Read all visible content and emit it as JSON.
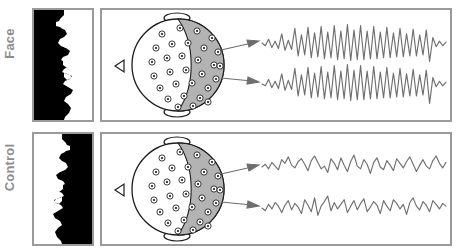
{
  "figure": {
    "title": "",
    "colors": {
      "panel_border": "#9a9a9a",
      "label_text": "#8d8d8d",
      "wave_stroke": "#6f6f6f",
      "head_shade": "#b3b3b3",
      "head_outline": "#1d1d1d",
      "arrow": "#6d6d6d",
      "stimulus_dark": "#000000",
      "stimulus_light": "#ffffff"
    }
  },
  "rows": [
    {
      "id": "face",
      "label": "Face",
      "stimulus": {
        "name": "mooney-face-stimulus",
        "description": "Two-tone Mooney face profile, black region on left, face silhouette facing right",
        "orientation": "upright"
      },
      "head_map": {
        "name": "eeg-head-map",
        "view": "top-down with nose at left",
        "electrode_count": 30,
        "shaded_region": "posterior"
      },
      "arrows": [
        {
          "name": "arrow-to-trace-1"
        },
        {
          "name": "arrow-to-trace-2"
        }
      ],
      "traces": [
        {
          "name": "eeg-trace-1",
          "activity": "high-amplitude regular oscillation",
          "samples": [
            0,
            -3,
            4,
            -5,
            2,
            -6,
            10,
            -8,
            3,
            -7,
            16,
            -14,
            9,
            -13,
            17,
            -16,
            11,
            -15,
            18,
            -17,
            12,
            -16,
            19,
            -18,
            13,
            -17,
            20,
            -19,
            14,
            -18,
            19,
            -18,
            13,
            -17,
            18,
            -17,
            12,
            -16,
            17,
            -16,
            11,
            -15,
            16,
            -15,
            10,
            -14,
            15,
            -14,
            9,
            -13,
            14,
            -20,
            6,
            -4,
            2,
            -3,
            1
          ]
        },
        {
          "name": "eeg-trace-2",
          "activity": "high-amplitude regular oscillation, phase-locked with trace 1",
          "samples": [
            0,
            -2,
            5,
            -4,
            3,
            -5,
            11,
            -7,
            4,
            -6,
            17,
            -13,
            10,
            -12,
            18,
            -15,
            12,
            -14,
            19,
            -16,
            13,
            -15,
            20,
            -17,
            14,
            -16,
            21,
            -18,
            15,
            -17,
            20,
            -17,
            14,
            -16,
            19,
            -16,
            13,
            -15,
            18,
            -15,
            12,
            -14,
            17,
            -14,
            11,
            -13,
            16,
            -13,
            10,
            -12,
            15,
            -21,
            7,
            -3,
            3,
            -2,
            2
          ]
        }
      ]
    },
    {
      "id": "control",
      "label": "Control",
      "stimulus": {
        "name": "control-stimulus",
        "description": "Mirrored and inverted version of the Mooney image, not perceived as a face",
        "orientation": "mirrored"
      },
      "head_map": {
        "name": "eeg-head-map",
        "view": "top-down with nose at left",
        "electrode_count": 30,
        "shaded_region": "posterior"
      },
      "arrows": [
        {
          "name": "arrow-to-trace-1"
        },
        {
          "name": "arrow-to-trace-2"
        }
      ],
      "traces": [
        {
          "name": "eeg-trace-1",
          "activity": "low-amplitude irregular desynchronized activity",
          "samples": [
            0,
            3,
            -2,
            5,
            1,
            -3,
            8,
            4,
            11,
            2,
            -1,
            6,
            9,
            3,
            -4,
            7,
            12,
            5,
            -2,
            1,
            -6,
            9,
            4,
            -3,
            10,
            2,
            -5,
            6,
            13,
            1,
            -2,
            8,
            3,
            -7,
            5,
            10,
            0,
            -3,
            7,
            2,
            -4,
            9,
            4,
            -1,
            6,
            11,
            3,
            -5,
            2,
            8,
            1,
            -2,
            7,
            12,
            4,
            -1,
            5
          ]
        },
        {
          "name": "eeg-trace-2",
          "activity": "low-amplitude irregular desynchronized activity, uncorrelated with trace 1",
          "samples": [
            0,
            -3,
            4,
            -1,
            6,
            2,
            -5,
            3,
            8,
            -2,
            5,
            1,
            -6,
            9,
            3,
            -4,
            11,
            -8,
            2,
            7,
            13,
            -3,
            6,
            -1,
            4,
            9,
            -5,
            2,
            8,
            -2,
            5,
            10,
            -4,
            1,
            7,
            3,
            -6,
            8,
            2,
            -3,
            9,
            5,
            -1,
            4,
            -7,
            6,
            11,
            2,
            -2,
            7,
            3,
            -4,
            8,
            4,
            -1,
            5,
            2
          ]
        }
      ]
    }
  ]
}
